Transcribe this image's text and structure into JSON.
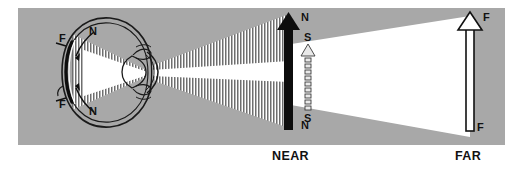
{
  "figure": {
    "background_color": "#ffffff",
    "panel_color": "#a8a8a8",
    "ink_color": "#111111",
    "beam_near_color": "#6e6e6e",
    "beam_far_color": "#ffffff"
  },
  "labels": {
    "near_caption": "NEAR",
    "far_caption": "FAR",
    "near_top": "N",
    "near_bottom": "N",
    "small_top": "S",
    "small_bottom": "S",
    "far_top": "F",
    "far_bottom": "F",
    "retina_n_top": "N",
    "retina_n_bottom": "N",
    "retina_f_top": "F",
    "retina_f_bottom": "F"
  },
  "objects": {
    "near_arrow": {
      "name": "near-object-arrow",
      "style": "solid-black",
      "tip_label": "N",
      "base_label": "N",
      "caption": "NEAR"
    },
    "small_arrow": {
      "name": "small-object-arrow",
      "style": "outlined-segmented",
      "tip_label": "S",
      "base_label": "S"
    },
    "far_arrow": {
      "name": "far-object-arrow",
      "style": "outline-white",
      "tip_label": "F",
      "base_label": "F",
      "caption": "FAR"
    }
  },
  "eye": {
    "name": "eye-cross-section",
    "parts": [
      "sclera",
      "cornea",
      "lens",
      "ciliary-body",
      "retina",
      "focal-arc"
    ],
    "focus_markers": {
      "retina_near": "N",
      "front_of_retina_far": "F"
    }
  },
  "beams": {
    "near_beam": {
      "name": "near-light-cone",
      "texture": "vertical-stripes",
      "color": "#6e6e6e"
    },
    "far_beam": {
      "name": "far-light-cone",
      "texture": "solid",
      "color": "#ffffff"
    }
  }
}
